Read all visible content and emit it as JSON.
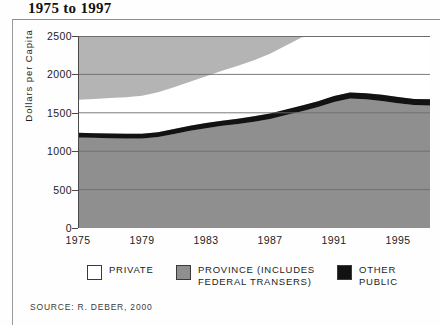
{
  "title": "1975 to 1997",
  "source_note": "Source: R. Deber, 2000",
  "colors": {
    "private": "#ffffff",
    "province": "#8f8f8f",
    "other_public": "#121212",
    "plot_background": "#b4b4b4",
    "gridline": "#6d6d6d",
    "axis": "#4a4a4a",
    "text": "#1c1c1c"
  },
  "axes": {
    "y_title": "Dollars per Capita",
    "y_ticks": [
      "2500",
      "2000",
      "1500",
      "1000",
      "500",
      "0"
    ],
    "x_ticks": [
      "1975",
      "1979",
      "1983",
      "1987",
      "1991",
      "1995"
    ]
  },
  "legend": [
    {
      "label": "Private",
      "swatch": "#ffffff"
    },
    {
      "label": "Province (includes federal transers)",
      "swatch": "#8f8f8f"
    },
    {
      "label": "Other Public",
      "swatch": "#121212"
    }
  ],
  "chart_data": {
    "type": "area",
    "title": "1975 to 1997",
    "xlabel": "",
    "ylabel": "Dollars per Capita",
    "xlim": [
      1975,
      1997
    ],
    "ylim": [
      0,
      2500
    ],
    "ytick_values": [
      0,
      500,
      1000,
      1500,
      2000,
      2500
    ],
    "xtick_values": [
      1975,
      1979,
      1983,
      1987,
      1991,
      1995
    ],
    "grid": true,
    "stacked": true,
    "legend_position": "bottom",
    "x": [
      1975,
      1976,
      1977,
      1978,
      1979,
      1980,
      1981,
      1982,
      1983,
      1984,
      1985,
      1986,
      1987,
      1988,
      1989,
      1990,
      1991,
      1992,
      1993,
      1994,
      1995,
      1996,
      1997
    ],
    "series": [
      {
        "name": "Province (includes federal transers)",
        "values": [
          1180,
          1175,
          1170,
          1165,
          1165,
          1185,
          1225,
          1265,
          1300,
          1330,
          1355,
          1385,
          1420,
          1470,
          1520,
          1575,
          1640,
          1685,
          1675,
          1655,
          1625,
          1600,
          1595
        ]
      },
      {
        "name": "Other Public",
        "values": [
          60,
          60,
          62,
          62,
          62,
          63,
          64,
          65,
          66,
          67,
          68,
          69,
          70,
          72,
          74,
          76,
          78,
          80,
          80,
          80,
          80,
          80,
          80
        ]
      },
      {
        "name": "Private",
        "values": [
          430,
          445,
          460,
          475,
          495,
          520,
          545,
          575,
          610,
          650,
          690,
          730,
          780,
          835,
          890,
          845,
          800,
          755,
          745,
          765,
          795,
          820,
          825
        ]
      }
    ],
    "totals": [
      1670,
      1680,
      1692,
      1702,
      1722,
      1768,
      1834,
      1905,
      1976,
      2047,
      2113,
      2184,
      2270,
      2377,
      2484,
      2496,
      2518,
      2520,
      2500,
      2500,
      2500,
      2500,
      2500
    ]
  }
}
